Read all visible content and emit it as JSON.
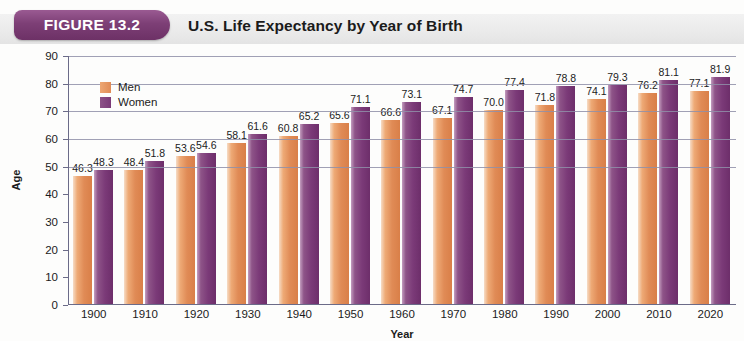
{
  "figure": {
    "badge_label": "FIGURE 13.2",
    "title": "U.S. Life Expectancy by Year of Birth"
  },
  "chart_data": {
    "type": "bar",
    "title": "U.S. Life Expectancy by Year of Birth",
    "xlabel": "Year",
    "ylabel": "Age",
    "ylim": [
      0,
      90
    ],
    "yticks": [
      0,
      10,
      20,
      30,
      40,
      50,
      60,
      70,
      80,
      90
    ],
    "grid": true,
    "legend_position": "top-left",
    "categories": [
      "1900",
      "1910",
      "1920",
      "1930",
      "1940",
      "1950",
      "1960",
      "1970",
      "1980",
      "1990",
      "2000",
      "2010",
      "2020"
    ],
    "series": [
      {
        "name": "Men",
        "color": "#e08b56",
        "values": [
          46.3,
          48.4,
          53.6,
          58.1,
          60.8,
          65.6,
          66.6,
          67.1,
          70.0,
          71.8,
          74.1,
          76.2,
          77.1
        ]
      },
      {
        "name": "Women",
        "color": "#7b3a78",
        "values": [
          48.3,
          51.8,
          54.6,
          61.6,
          65.2,
          71.1,
          73.1,
          74.7,
          77.4,
          78.8,
          79.3,
          81.1,
          81.9
        ]
      }
    ]
  }
}
